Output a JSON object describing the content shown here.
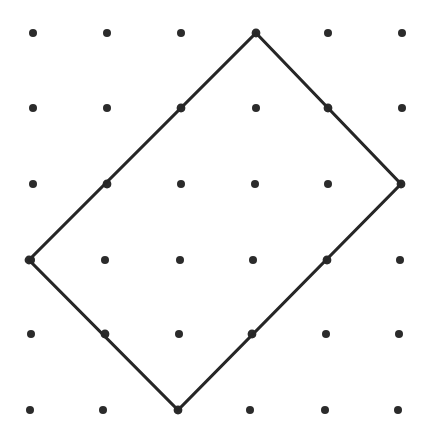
{
  "figure": {
    "type": "geometry-lattice-diagram",
    "canvas": {
      "width": 422,
      "height": 439,
      "background_color": "#ffffff"
    },
    "lattice": {
      "label": "dot grid",
      "rows": 6,
      "columns": 6,
      "origin_x": 33,
      "origin_y": 33,
      "spacing_x": 73.8,
      "spacing_y": 75.4,
      "dot_radius": 4.0,
      "dot_color": "#2b2b2b",
      "points": [
        [
          33,
          33
        ],
        [
          107,
          33
        ],
        [
          181,
          33
        ],
        [
          256,
          33
        ],
        [
          328,
          33
        ],
        [
          402,
          33
        ],
        [
          33,
          108
        ],
        [
          107,
          108
        ],
        [
          181,
          108
        ],
        [
          256,
          108
        ],
        [
          328,
          108
        ],
        [
          402,
          108
        ],
        [
          33,
          184
        ],
        [
          107,
          184
        ],
        [
          181,
          184
        ],
        [
          255,
          184
        ],
        [
          328,
          184
        ],
        [
          401,
          184
        ],
        [
          31,
          260
        ],
        [
          105,
          260
        ],
        [
          180,
          260
        ],
        [
          253,
          260
        ],
        [
          327,
          260
        ],
        [
          400,
          260
        ],
        [
          31,
          334
        ],
        [
          105,
          334
        ],
        [
          179,
          334
        ],
        [
          252,
          334
        ],
        [
          326,
          334
        ],
        [
          399,
          334
        ],
        [
          30,
          410
        ],
        [
          103,
          410
        ],
        [
          178,
          410
        ],
        [
          250,
          410
        ],
        [
          325,
          410
        ],
        [
          398,
          410
        ]
      ]
    },
    "polygon": {
      "label": "tilted rectangle",
      "sides": 4,
      "stroke_color": "#262626",
      "stroke_width": 3.1,
      "fill": "none",
      "vertices": [
        {
          "name": "top-vertex",
          "x": 256,
          "y": 33
        },
        {
          "name": "right-vertex",
          "x": 401,
          "y": 184
        },
        {
          "name": "bottom-vertex",
          "x": 178,
          "y": 410
        },
        {
          "name": "left-vertex",
          "x": 29,
          "y": 260
        }
      ],
      "edge_lattice_points": [
        {
          "name": "top-left-edge-midpoint",
          "x": 181,
          "y": 108
        },
        {
          "name": "top-right-edge-midpoint",
          "x": 328,
          "y": 108
        },
        {
          "name": "upper-left-edge-point",
          "x": 107,
          "y": 184
        },
        {
          "name": "right-edge-point",
          "x": 327,
          "y": 260
        },
        {
          "name": "lower-left-edge-point",
          "x": 105,
          "y": 334
        },
        {
          "name": "lower-right-edge-point",
          "x": 252,
          "y": 334
        }
      ]
    }
  },
  "chart_data": {
    "type": "scatter",
    "xlabel": "",
    "ylabel": "",
    "xlim": [
      0,
      422
    ],
    "ylim": [
      0,
      439
    ],
    "grid": false,
    "legend": "none",
    "series": [
      {
        "name": "lattice points",
        "marker": "filled-circle",
        "color": "#2b2b2b",
        "x": [
          33,
          107,
          181,
          256,
          328,
          402,
          33,
          107,
          181,
          256,
          328,
          402,
          33,
          107,
          181,
          255,
          328,
          401,
          31,
          105,
          180,
          253,
          327,
          400,
          31,
          105,
          179,
          252,
          326,
          399,
          30,
          103,
          178,
          250,
          325,
          398
        ],
        "y": [
          33,
          33,
          33,
          33,
          33,
          33,
          108,
          108,
          108,
          108,
          108,
          108,
          184,
          184,
          184,
          184,
          184,
          184,
          260,
          260,
          260,
          260,
          260,
          260,
          334,
          334,
          334,
          334,
          334,
          334,
          410,
          410,
          410,
          410,
          410,
          410
        ]
      },
      {
        "name": "tilted rectangle outline",
        "marker": "none",
        "line": "solid",
        "color": "#262626",
        "closed": true,
        "x": [
          256,
          401,
          178,
          29
        ],
        "y": [
          33,
          184,
          410,
          260
        ]
      }
    ]
  }
}
